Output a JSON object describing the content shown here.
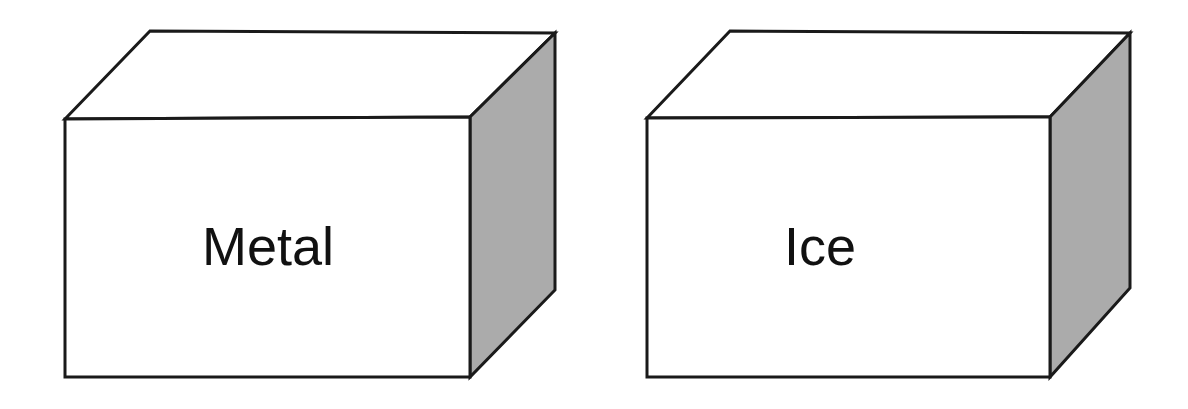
{
  "figure": {
    "background_color": "#ffffff",
    "outline_color": "#1a1a1a",
    "outline_width": 3,
    "front_face_color": "#ffffff",
    "top_face_color": "#ffffff",
    "side_face_color": "#ababab",
    "label_color": "#111111",
    "label_font_size": 54
  },
  "blocks": [
    {
      "id": "metal-block",
      "label": "Metal",
      "label_x": 268,
      "label_y": 265,
      "front_face": {
        "x": 65,
        "y": 119,
        "width": 405,
        "height": 258,
        "points": "65,119 470,117 470,377 65,377"
      },
      "top_face": {
        "points": "65,119 150,31 555,33 470,117"
      },
      "side_face": {
        "points": "470,117 555,33 555,290 470,377"
      }
    },
    {
      "id": "ice-block",
      "label": "Ice",
      "label_x": 820,
      "label_y": 265,
      "front_face": {
        "x": 647,
        "y": 118,
        "width": 403,
        "height": 259,
        "points": "647,118 1050,117 1050,377 647,377"
      },
      "top_face": {
        "points": "647,118 730,31 1130,33 1050,117"
      },
      "side_face": {
        "points": "1050,117 1130,33 1130,288 1050,377"
      }
    }
  ],
  "chart_data": {
    "type": "diagram",
    "items": [
      {
        "name": "Metal",
        "shape": "rectangular block",
        "position": "left"
      },
      {
        "name": "Ice",
        "shape": "rectangular block",
        "position": "right"
      }
    ]
  }
}
